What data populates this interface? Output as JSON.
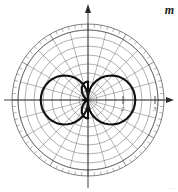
{
  "figure": {
    "type": "polar-radiation-pattern",
    "background_color": "#ffffff",
    "grid_color": "#6b6b6b",
    "curve_color": "#111111",
    "axis_color": "#2a2a2a",
    "axis_symbol_right": "m",
    "corner_mark": "=="
  },
  "axes": {
    "center_x": 88,
    "center_y": 100,
    "outer_radius": 76,
    "horizontal_axis_label": "",
    "vertical_axis_label": "",
    "horizontal_tick_labels": [
      "2",
      "3"
    ],
    "horizontal_tick_label_positions": [
      123,
      155
    ],
    "vertical_tick_labels": [],
    "arrow_right": true,
    "arrow_up": true
  },
  "chart_data": {
    "type": "line",
    "title": "",
    "subtitle": "",
    "xlabel": "",
    "ylabel": "",
    "coordinate_system": "polar",
    "grid": true,
    "legend_position": "none",
    "radial_rings": 8,
    "radial_ring_values": [
      1,
      2,
      3,
      4,
      5,
      6,
      7,
      8
    ],
    "rlim": [
      0,
      8
    ],
    "angular_spokes_deg": [
      0,
      15,
      30,
      45,
      60,
      75,
      90,
      105,
      120,
      135,
      150,
      165,
      180,
      195,
      210,
      225,
      240,
      255,
      270,
      285,
      300,
      315,
      330,
      345
    ],
    "outer_tick_ring": true,
    "outer_tick_count": 72,
    "tick_labels": [
      "2",
      "3"
    ],
    "annotations": [
      "m"
    ],
    "series": [
      {
        "name": "main-lobes",
        "description": "Two large lobes along the horizontal axis",
        "pattern_function": "abs(sin(theta))-like lateral lobe",
        "theta_deg": [
          0,
          5,
          10,
          15,
          20,
          25,
          30,
          35,
          40,
          45,
          50,
          55,
          60,
          65,
          70,
          75,
          80,
          85,
          90,
          95,
          100,
          105,
          110,
          115,
          120,
          125,
          130,
          135,
          140,
          145,
          150,
          155,
          160,
          165,
          170,
          175,
          180,
          185,
          190,
          195,
          200,
          205,
          210,
          215,
          220,
          225,
          230,
          235,
          240,
          245,
          250,
          255,
          260,
          265,
          270,
          275,
          280,
          285,
          290,
          295,
          300,
          305,
          310,
          315,
          320,
          325,
          330,
          335,
          340,
          345,
          350,
          355,
          360
        ],
        "r": [
          5.4,
          5.38,
          5.33,
          5.24,
          5.11,
          4.95,
          4.75,
          4.52,
          4.25,
          3.95,
          3.62,
          3.27,
          2.9,
          2.51,
          2.1,
          1.69,
          1.27,
          0.84,
          0.4,
          0.84,
          1.27,
          1.69,
          2.1,
          2.51,
          2.9,
          3.27,
          3.62,
          3.95,
          4.25,
          4.52,
          4.75,
          4.95,
          5.11,
          5.24,
          5.33,
          5.38,
          5.4,
          5.38,
          5.33,
          5.24,
          5.11,
          4.95,
          4.75,
          4.52,
          4.25,
          3.95,
          3.62,
          3.27,
          2.9,
          2.51,
          2.1,
          1.69,
          1.27,
          0.84,
          0.4,
          0.84,
          1.27,
          1.69,
          2.1,
          2.51,
          2.9,
          3.27,
          3.62,
          3.95,
          4.25,
          4.52,
          4.75,
          4.95,
          5.11,
          5.24,
          5.33,
          5.38,
          5.4
        ]
      },
      {
        "name": "minor-lobes",
        "description": "Two small vertical lobes at the center along the vertical axis",
        "theta_deg": [
          90,
          95,
          100,
          105,
          110,
          115,
          120,
          125,
          130,
          135,
          140,
          145,
          150,
          155,
          160,
          165,
          170,
          175,
          180,
          185,
          190,
          195,
          200,
          205,
          210,
          215,
          220,
          225,
          230,
          235,
          240,
          245,
          250,
          255,
          260,
          265,
          270
        ],
        "r": [
          2.1,
          2.08,
          2.02,
          1.92,
          1.79,
          1.62,
          1.43,
          1.22,
          1.0,
          0.78,
          0.56,
          0.36,
          0.18,
          0.06,
          0.0,
          0.06,
          0.18,
          0.36,
          0.56,
          0.36,
          0.18,
          0.06,
          0.0,
          0.06,
          0.18,
          0.36,
          0.56,
          0.78,
          1.0,
          1.22,
          1.43,
          1.62,
          1.79,
          1.92,
          2.02,
          2.08,
          2.1
        ]
      }
    ]
  }
}
